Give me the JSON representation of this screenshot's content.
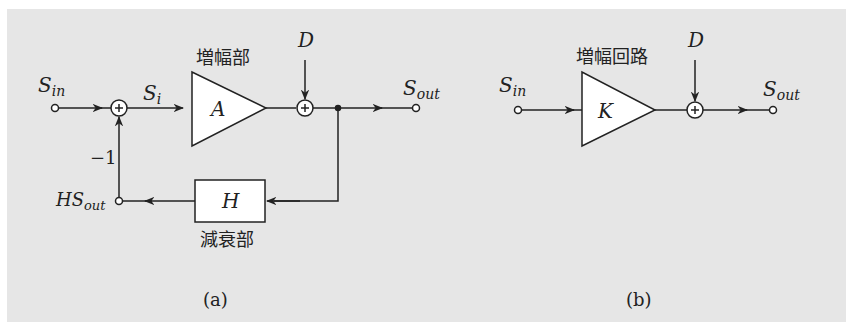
{
  "figure": {
    "background_color": "#e6e6e6",
    "line_color": "#222222",
    "diagram_a": {
      "caption": "(a)",
      "input_label": "S",
      "input_sub": "in",
      "sum_input_label": "S",
      "sum_input_sub": "i",
      "amplifier_title": "増幅部",
      "amplifier_symbol": "A",
      "disturbance_label": "D",
      "output_label": "S",
      "output_sub": "out",
      "feedback_block_symbol": "H",
      "feedback_block_title": "減衰部",
      "feedback_output_label": "HS",
      "feedback_output_sub": "out",
      "feedback_gain": "−1",
      "summing_symbol": "+"
    },
    "diagram_b": {
      "caption": "(b)",
      "input_label": "S",
      "input_sub": "in",
      "amplifier_title": "増幅回路",
      "amplifier_symbol": "K",
      "disturbance_label": "D",
      "output_label": "S",
      "output_sub": "out",
      "summing_symbol": "+"
    }
  }
}
